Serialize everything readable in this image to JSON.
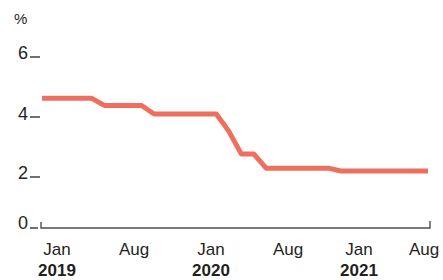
{
  "chart_data": {
    "type": "line",
    "title": "",
    "subtitle": "",
    "xlabel": "",
    "ylabel": "%",
    "unit_label": "%",
    "ylim": [
      0,
      6.6
    ],
    "y_ticks": [
      0,
      2,
      4,
      6
    ],
    "y_tick_labels": [
      "0",
      "2",
      "4",
      "6"
    ],
    "grid": false,
    "legend": "none",
    "line_color": "#ef6f5e",
    "axis_color": "#4d4d4d",
    "x": [
      "Jan 2019",
      "Feb 2019",
      "Mar 2019",
      "Apr 2019",
      "May 2019",
      "Jun 2019",
      "Jul 2019",
      "Aug 2019",
      "Sep 2019",
      "Oct 2019",
      "Nov 2019",
      "Dec 2019",
      "Jan 2020",
      "Feb 2020",
      "Mar 2020",
      "Apr 2020",
      "May 2020",
      "Jun 2020",
      "Jul 2020",
      "Aug 2020",
      "Sep 2020",
      "Oct 2020",
      "Nov 2020",
      "Dec 2020",
      "Jan 2021",
      "Feb 2021",
      "Mar 2021",
      "Apr 2021",
      "May 2021",
      "Jun 2021",
      "Jul 2021",
      "Aug 2021"
    ],
    "values": [
      4.55,
      4.55,
      4.55,
      4.55,
      4.55,
      4.3,
      4.3,
      4.3,
      4.3,
      4.0,
      4.0,
      4.0,
      4.0,
      4.0,
      4.0,
      3.4,
      2.6,
      2.6,
      2.1,
      2.1,
      2.1,
      2.1,
      2.1,
      2.1,
      2.0,
      2.0,
      2.0,
      2.0,
      2.0,
      2.0,
      2.0,
      2.0
    ],
    "series": [
      {
        "name": "Rate",
        "color": "#ef6f5e",
        "values": [
          4.55,
          4.55,
          4.55,
          4.55,
          4.55,
          4.3,
          4.3,
          4.3,
          4.3,
          4.0,
          4.0,
          4.0,
          4.0,
          4.0,
          4.0,
          3.4,
          2.6,
          2.6,
          2.1,
          2.1,
          2.1,
          2.1,
          2.1,
          2.1,
          2.0,
          2.0,
          2.0,
          2.0,
          2.0,
          2.0,
          2.0,
          2.0
        ]
      }
    ],
    "x_tick_positions": [
      "Jan 2019",
      "Aug 2019",
      "Jan 2020",
      "Aug 2020",
      "Jan 2021",
      "Aug 2021"
    ],
    "x_tick_months": [
      "Jan",
      "Aug",
      "Jan",
      "Aug",
      "Jan",
      "Aug"
    ],
    "x_tick_years": [
      "2019",
      "",
      "2020",
      "",
      "2021",
      ""
    ]
  },
  "axis": {
    "unit": "%",
    "y_labels": [
      "6",
      "4",
      "2",
      "0"
    ]
  },
  "x_axis": {
    "ticks": [
      {
        "month": "Jan",
        "year": "2019"
      },
      {
        "month": "Aug",
        "year": ""
      },
      {
        "month": "Jan",
        "year": "2020"
      },
      {
        "month": "Aug",
        "year": ""
      },
      {
        "month": "Jan",
        "year": "2021"
      },
      {
        "month": "Aug",
        "year": ""
      }
    ]
  }
}
